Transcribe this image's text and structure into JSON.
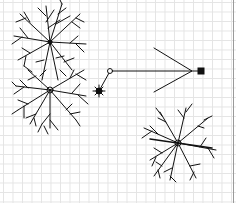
{
  "canvas": {
    "type": "cad-drawing-grid",
    "grid_color": "#e4e4e4",
    "stroke_color": "#111111"
  },
  "symbols": [
    {
      "name": "tree-symbol-1",
      "cx": 50,
      "cy": 42,
      "r": 38
    },
    {
      "name": "tree-symbol-2",
      "cx": 50,
      "cy": 90,
      "r": 40
    },
    {
      "name": "tree-symbol-3",
      "cx": 178,
      "cy": 143,
      "r": 40
    },
    {
      "name": "small-shrub-symbol",
      "cx": 99,
      "cy": 91,
      "r": 4
    }
  ],
  "leader": {
    "start_node": {
      "x": 110,
      "y": 71
    },
    "end_node": {
      "x": 201,
      "y": 71
    },
    "arrow_tip": {
      "x": 192,
      "y": 71
    }
  }
}
